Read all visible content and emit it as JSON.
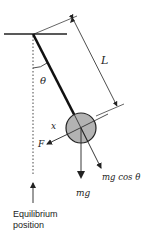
{
  "labels": {
    "length": "L",
    "angle": "θ",
    "displacement": "x",
    "restoring_force": "F",
    "weight": "mg",
    "weight_component": "mg cos θ",
    "equilibrium_line1": "Equilibrium",
    "equilibrium_line2": "position"
  },
  "colors": {
    "line": "#222222",
    "bob_fill": "#b3b3b3",
    "background": "#ffffff"
  },
  "icons": {
    "bob": "pendulum-bob-icon",
    "arrow": "arrow-icon"
  }
}
